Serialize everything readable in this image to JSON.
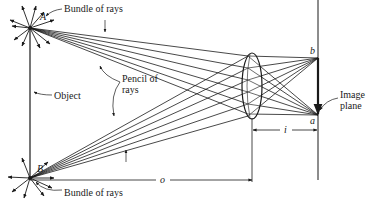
{
  "figure": {
    "labels": {
      "bundle_top": "Bundle of rays",
      "bundle_bottom": "Bundle of rays",
      "pencil_line1": "Pencil of",
      "pencil_line2": "rays",
      "object": "Object",
      "image_plane_line1": "Image",
      "image_plane_line2": "plane",
      "point_A": "A",
      "point_B": "B",
      "point_a": "a",
      "point_b": "b",
      "object_distance": "o",
      "image_distance": "i"
    },
    "colors": {
      "ink": "#1a1a1a",
      "background": "#ffffff"
    }
  }
}
